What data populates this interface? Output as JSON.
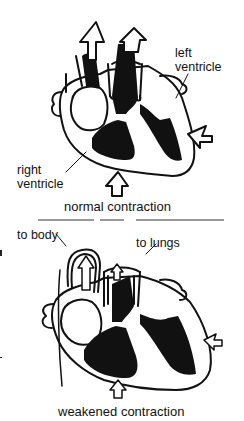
{
  "panels": [
    {
      "id": "normal",
      "labels": {
        "left_ventricle_line1": "left",
        "left_ventricle_line2": "ventricle",
        "right_ventricle_line1": "right",
        "right_ventricle_line2": "ventricle"
      },
      "caption": "normal contraction"
    },
    {
      "id": "weakened",
      "labels": {
        "to_body": "to body",
        "to_lungs": "to lungs"
      },
      "caption": "weakened contraction"
    }
  ],
  "colors": {
    "ink": "#111111",
    "background": "#ffffff"
  }
}
